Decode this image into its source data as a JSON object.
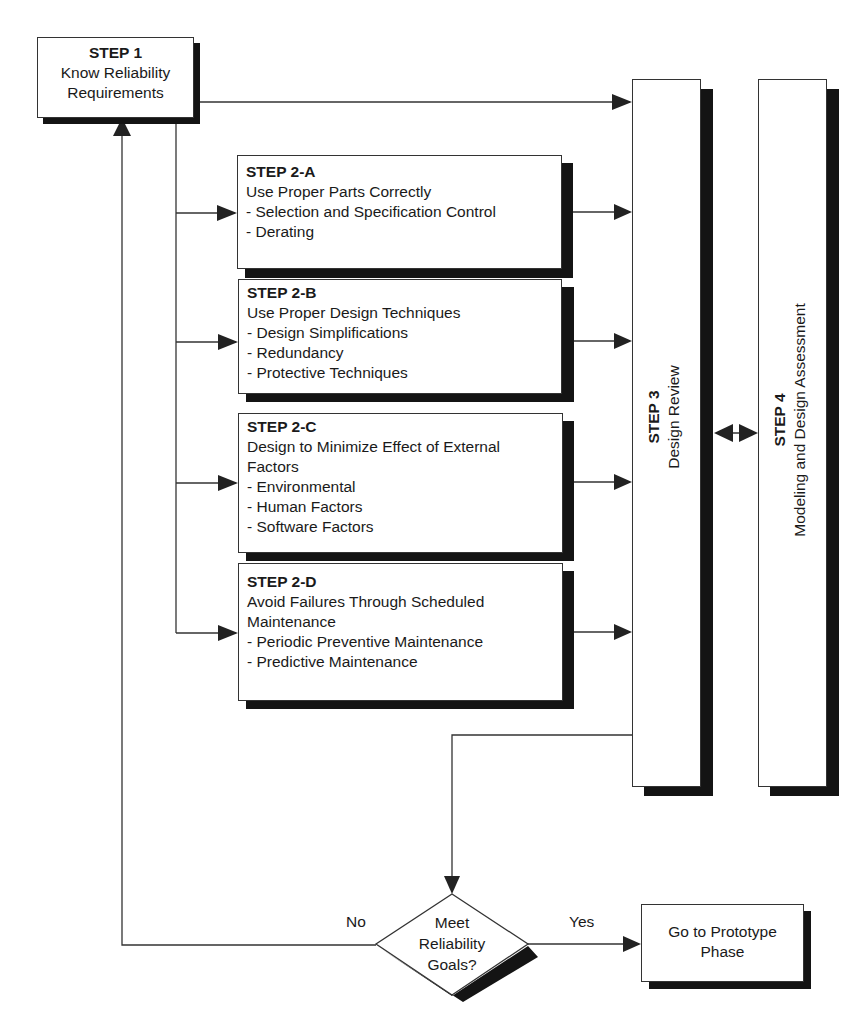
{
  "diagram": {
    "step1": {
      "title": "STEP 1",
      "lines": [
        "Know Reliability",
        "Requirements"
      ]
    },
    "step2a": {
      "title": "STEP 2-A",
      "lines": [
        "Use Proper Parts Correctly",
        "- Selection and Specification Control",
        "- Derating"
      ]
    },
    "step2b": {
      "title": "STEP 2-B",
      "lines": [
        "Use Proper Design Techniques",
        "- Design Simplifications",
        "- Redundancy",
        "- Protective Techniques"
      ]
    },
    "step2c": {
      "title": "STEP 2-C",
      "lines": [
        "Design to Minimize Effect of External",
        "Factors",
        "- Environmental",
        "- Human Factors",
        "- Software Factors"
      ]
    },
    "step2d": {
      "title": "STEP 2-D",
      "lines": [
        "Avoid Failures Through Scheduled",
        "Maintenance",
        "- Periodic Preventive Maintenance",
        "- Predictive Maintenance"
      ]
    },
    "step3": {
      "title": "STEP 3",
      "subtitle": "Design Review"
    },
    "step4": {
      "title": "STEP 4",
      "subtitle": "Modeling and Design Assessment"
    },
    "decision": {
      "lines": [
        "Meet",
        "Reliability",
        "Goals?"
      ]
    },
    "branch_no": "No",
    "branch_yes": "Yes",
    "outcome": {
      "lines": [
        "Go to Prototype",
        "Phase"
      ]
    }
  },
  "colors": {
    "line": "#333333",
    "shadow": "#141414",
    "background": "#ffffff"
  }
}
